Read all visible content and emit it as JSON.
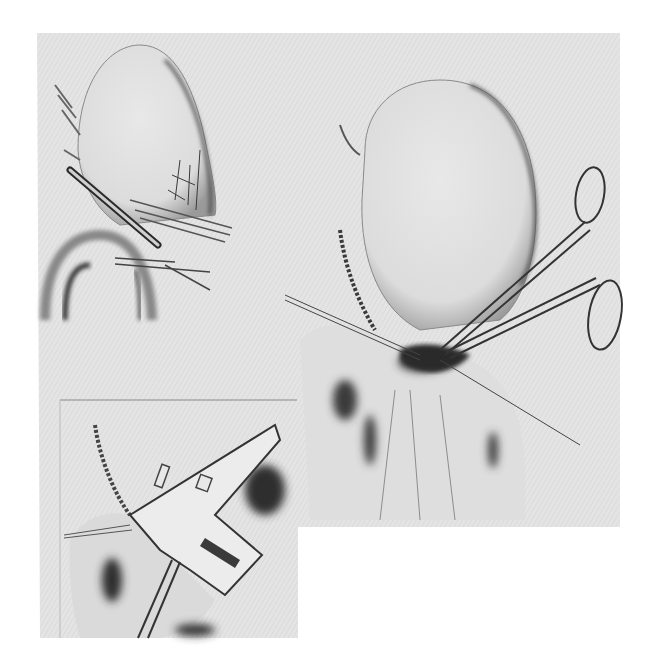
{
  "figure": {
    "type": "surgical-illustration",
    "style": "grayscale pencil drawing",
    "panels": [
      {
        "id": "top-left",
        "subject": "organ with clamp and forceps"
      },
      {
        "id": "right",
        "subject": "organ with ring-handled forceps and suture"
      },
      {
        "id": "bottom-left",
        "subject": "organ with retractor instrument"
      }
    ]
  },
  "colors": {
    "page": "#ffffff",
    "background": "#e6e6e6",
    "organ_fill": "#dadada",
    "line_dark": "#2a2a2a",
    "line_mid": "#707070",
    "shadow": "#555555"
  }
}
